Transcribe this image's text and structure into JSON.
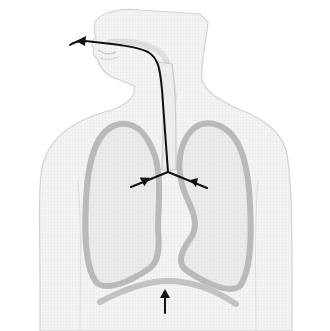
{
  "diagram": {
    "title": "Human respiratory system - exhalation airflow",
    "colors": {
      "background": "#ffffff",
      "body_fill": "#f3f3f3",
      "body_outline": "#cfcfcf",
      "lung_fill": "#e9e9e9",
      "lung_outline": "#b9b9b9",
      "diaphragm": "#c2c2c2",
      "airflow_arrow": "#111111"
    },
    "parts": [
      {
        "id": "head",
        "label": "Head and face"
      },
      {
        "id": "trachea",
        "label": "Trachea"
      },
      {
        "id": "left-lung",
        "label": "Left lung"
      },
      {
        "id": "right-lung",
        "label": "Right lung"
      },
      {
        "id": "diaphragm",
        "label": "Diaphragm"
      }
    ],
    "arrows": [
      {
        "id": "airflow-out-mouth",
        "description": "Air flowing out through the mouth"
      },
      {
        "id": "bronchus-left",
        "description": "Air moving from left bronchus into trachea"
      },
      {
        "id": "bronchus-right",
        "description": "Air moving from right bronchus into trachea"
      },
      {
        "id": "diaphragm-up",
        "description": "Diaphragm moving upward"
      }
    ]
  }
}
